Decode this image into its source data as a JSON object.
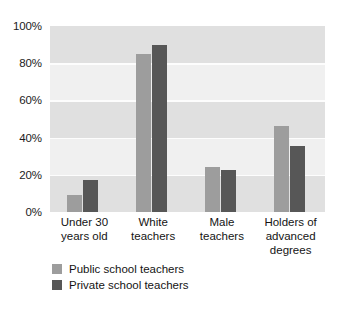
{
  "chart_data": {
    "type": "bar",
    "title": "",
    "xlabel": "",
    "ylabel": "",
    "ylim": [
      0,
      100
    ],
    "grid": true,
    "legend_position": "bottom-left",
    "categories": [
      "Under 30\nyears old",
      "White\nteachers",
      "Male\nteachers",
      "Holders of\nadvanced\ndegrees"
    ],
    "category_lines": [
      [
        "Under 30",
        "years old"
      ],
      [
        "White",
        "teachers"
      ],
      [
        "Male",
        "teachers"
      ],
      [
        "Holders of",
        "advanced",
        "degrees"
      ]
    ],
    "y_ticks": [
      "0%",
      "20%",
      "40%",
      "60%",
      "80%",
      "100%"
    ],
    "y_tick_values": [
      0,
      20,
      40,
      60,
      80,
      100
    ],
    "series": [
      {
        "name": "Public school teachers",
        "color": "#9d9d9d",
        "values": [
          9,
          85,
          24,
          46
        ]
      },
      {
        "name": "Private school teachers",
        "color": "#575757",
        "values": [
          17,
          90,
          22.5,
          35.5
        ]
      }
    ]
  },
  "legend": {
    "items": [
      {
        "label": "Public school teachers",
        "color": "#9d9d9d"
      },
      {
        "label": "Private school teachers",
        "color": "#575757"
      }
    ]
  },
  "colors": {
    "plot_background": "#ebebeb",
    "band_light": "#f0f0f0",
    "gridline": "#fdfdfd",
    "text": "#141414"
  }
}
